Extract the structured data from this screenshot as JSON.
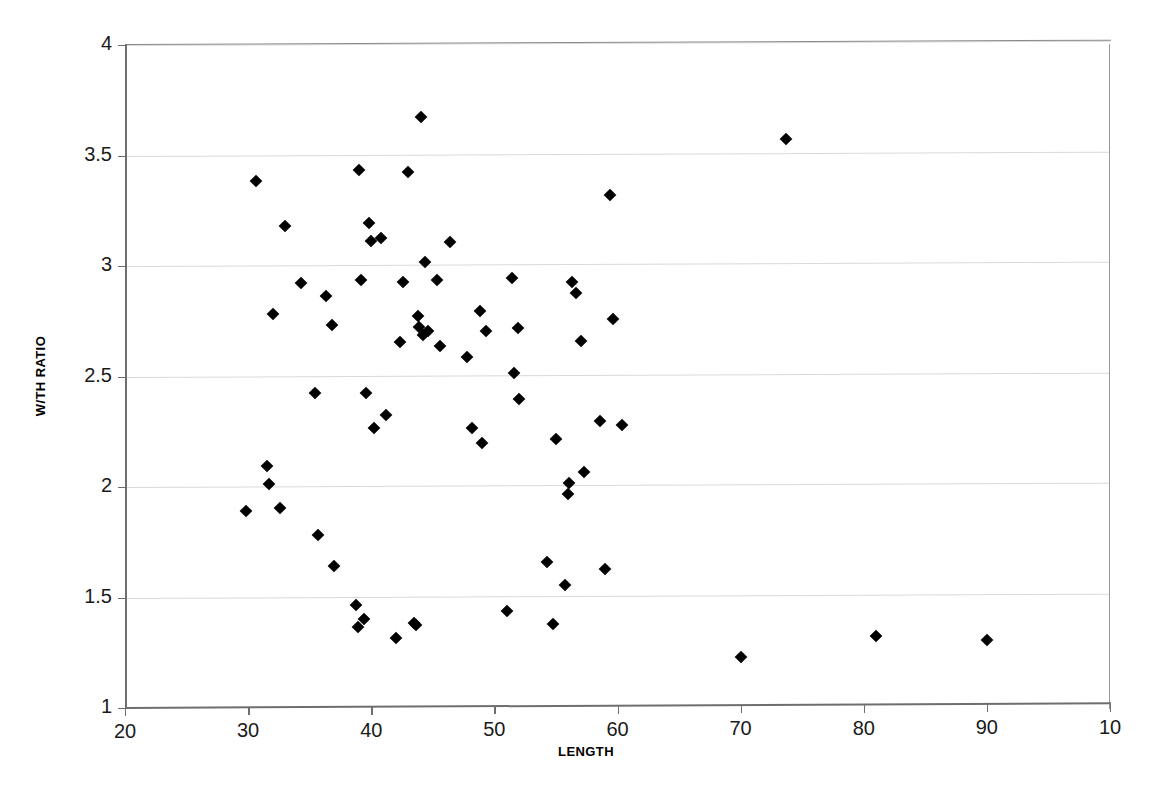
{
  "chart_data": {
    "type": "scatter",
    "title": "",
    "xlabel": "LENGTH",
    "ylabel": "W/TH RATIO",
    "xlim": [
      20,
      100
    ],
    "ylim": [
      1,
      4
    ],
    "xticks": [
      20,
      30,
      40,
      50,
      60,
      70,
      80,
      90,
      100
    ],
    "xtick_labels": [
      "20",
      "30",
      "40",
      "50",
      "60",
      "70",
      "80",
      "90",
      "10"
    ],
    "yticks": [
      1,
      1.5,
      2,
      2.5,
      3,
      3.5,
      4
    ],
    "ytick_labels": [
      "1",
      "1.5",
      "2",
      "2.5",
      "3",
      "3.5",
      "4"
    ],
    "grid": "horizontal",
    "legend": "none",
    "marker": "diamond",
    "marker_color": "#000000",
    "series": [
      {
        "name": "W/TH RATIO vs LENGTH",
        "points": [
          [
            29.8,
            1.89
          ],
          [
            30.6,
            3.38
          ],
          [
            31.5,
            2.09
          ],
          [
            31.7,
            2.01
          ],
          [
            32.0,
            2.78
          ],
          [
            32.6,
            1.9
          ],
          [
            33.0,
            3.18
          ],
          [
            34.3,
            2.92
          ],
          [
            35.4,
            2.42
          ],
          [
            35.7,
            1.78
          ],
          [
            36.3,
            2.86
          ],
          [
            36.8,
            2.73
          ],
          [
            37.0,
            1.64
          ],
          [
            38.8,
            1.46
          ],
          [
            38.9,
            1.36
          ],
          [
            39.0,
            3.43
          ],
          [
            39.2,
            2.93
          ],
          [
            39.4,
            1.4
          ],
          [
            39.6,
            2.42
          ],
          [
            39.8,
            3.19
          ],
          [
            40.0,
            3.11
          ],
          [
            40.2,
            2.26
          ],
          [
            40.8,
            3.12
          ],
          [
            41.2,
            2.32
          ],
          [
            42.0,
            1.31
          ],
          [
            42.3,
            2.65
          ],
          [
            42.6,
            2.92
          ],
          [
            43.0,
            3.42
          ],
          [
            43.5,
            1.38
          ],
          [
            43.6,
            1.37
          ],
          [
            43.8,
            2.77
          ],
          [
            43.9,
            2.72
          ],
          [
            44.0,
            3.67
          ],
          [
            44.2,
            2.68
          ],
          [
            44.4,
            3.01
          ],
          [
            44.6,
            2.7
          ],
          [
            45.3,
            2.93
          ],
          [
            45.6,
            2.63
          ],
          [
            46.4,
            3.1
          ],
          [
            47.8,
            2.58
          ],
          [
            48.2,
            2.26
          ],
          [
            48.8,
            2.79
          ],
          [
            49.0,
            2.19
          ],
          [
            49.3,
            2.7
          ],
          [
            51.0,
            1.43
          ],
          [
            51.4,
            2.94
          ],
          [
            51.6,
            2.51
          ],
          [
            51.9,
            2.71
          ],
          [
            52.0,
            2.39
          ],
          [
            54.3,
            1.65
          ],
          [
            54.8,
            1.37
          ],
          [
            55.0,
            2.21
          ],
          [
            55.7,
            1.55
          ],
          [
            56.0,
            1.96
          ],
          [
            56.1,
            2.01
          ],
          [
            56.3,
            2.92
          ],
          [
            56.6,
            2.87
          ],
          [
            57.0,
            2.65
          ],
          [
            57.3,
            2.06
          ],
          [
            58.6,
            2.29
          ],
          [
            59.0,
            1.62
          ],
          [
            59.4,
            3.31
          ],
          [
            59.6,
            2.75
          ],
          [
            60.4,
            2.27
          ],
          [
            70.0,
            1.22
          ],
          [
            73.7,
            3.56
          ],
          [
            81.0,
            1.31
          ],
          [
            90.0,
            1.29
          ]
        ]
      }
    ]
  }
}
